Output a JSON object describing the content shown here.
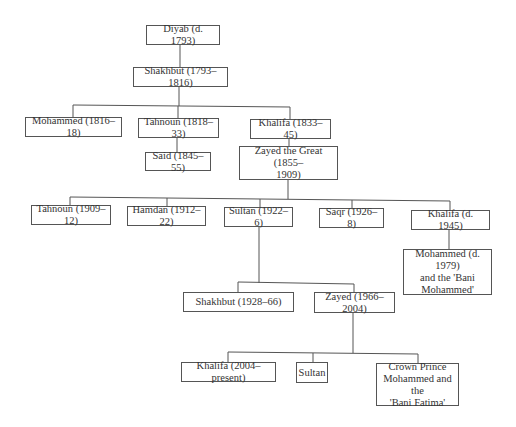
{
  "diagram": {
    "type": "family-tree",
    "nodes": {
      "diyab": "Diyab (d. 1793)",
      "shakhbut1": "Shakhbut (1793–1816)",
      "mohammed1": "Mohammed (1816–18)",
      "tahnoun1": "Tahnoun (1818–33)",
      "khalifa1": "Khalifa (1833–45)",
      "said": "Said (1845–55)",
      "zayed_great": "Zayed the Great (1855–\n1909)",
      "tahnoun2": "Tahnoun (1909–12)",
      "hamdan": "Hamdan (1912–22)",
      "sultan1": "Sultan (1922–6)",
      "saqr": "Saqr (1926–8)",
      "khalifa2": "Khalifa (d. 1945)",
      "mohammed2": "Mohammed (d. 1979)\nand the 'Bani\nMohammed'",
      "shakhbut2": "Shakhbut (1928–66)",
      "zayed2": "Zayed (1966–2004)",
      "khalifa3": "Khalifa (2004–present)",
      "sultan2": "Sultan",
      "crown_prince": "Crown Prince\nMohammed and the\n'Bani Fatima'"
    },
    "edges": [
      [
        "diyab",
        "shakhbut1"
      ],
      [
        "shakhbut1",
        "mohammed1"
      ],
      [
        "shakhbut1",
        "tahnoun1"
      ],
      [
        "shakhbut1",
        "khalifa1"
      ],
      [
        "tahnoun1",
        "said"
      ],
      [
        "khalifa1",
        "zayed_great"
      ],
      [
        "zayed_great",
        "tahnoun2"
      ],
      [
        "zayed_great",
        "hamdan"
      ],
      [
        "zayed_great",
        "sultan1"
      ],
      [
        "zayed_great",
        "saqr"
      ],
      [
        "zayed_great",
        "khalifa2"
      ],
      [
        "khalifa2",
        "mohammed2"
      ],
      [
        "sultan1",
        "shakhbut2"
      ],
      [
        "sultan1",
        "zayed2"
      ],
      [
        "zayed2",
        "khalifa3"
      ],
      [
        "zayed2",
        "sultan2"
      ],
      [
        "zayed2",
        "crown_prince"
      ]
    ]
  }
}
